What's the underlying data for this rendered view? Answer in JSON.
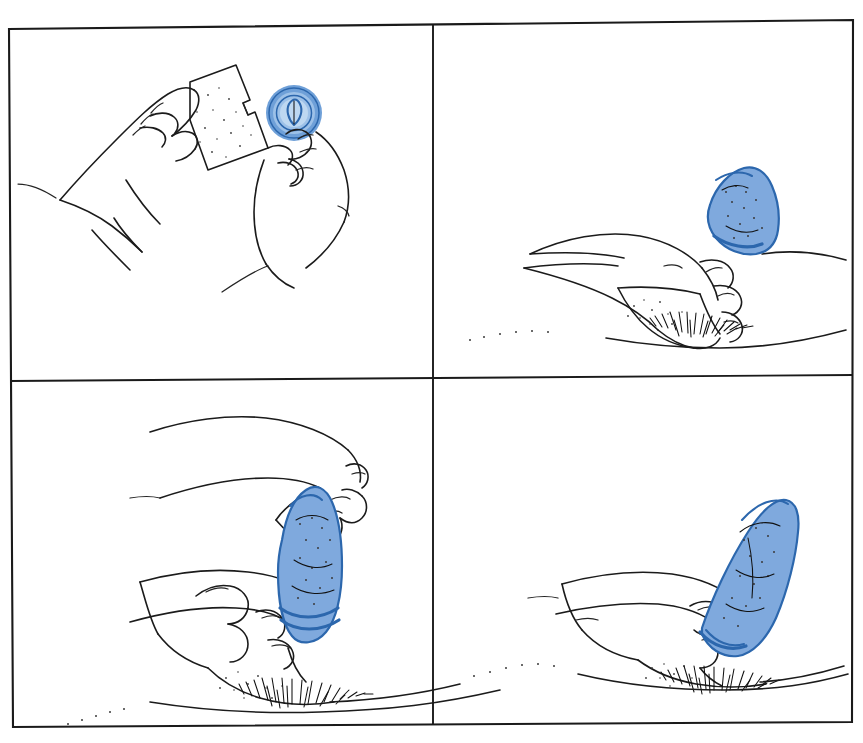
{
  "document": {
    "kind": "instructional-diagram",
    "title": "Condom use — step-by-step illustrated instructions",
    "description": "Wordless four-panel line-art health education sequence, scanned from a printed family-planning pamphlet.",
    "panel_count": 4,
    "has_captions": false,
    "has_step_numbers": false,
    "background_color": "#ffffff",
    "ink_color": "#1b1b1b",
    "accent_color": "#7fa9dd",
    "accent_outline_color": "#2c67ad"
  },
  "layout": {
    "canvas_width": 863,
    "canvas_height": 743,
    "grid_rows": 2,
    "grid_columns": 2,
    "frame_skew_note": "Scanned page: frame edges are slightly tilted, top edge rises left to right.",
    "frame": {
      "top_left_x": 9,
      "top_left_y": 29,
      "top_right_x": 853,
      "top_right_y": 20,
      "bottom_right_x": 852,
      "bottom_right_y": 722,
      "bottom_left_x": 13,
      "bottom_left_y": 727
    },
    "divider_vertical_x": 433,
    "divider_horizontal_y": 381
  },
  "panels": [
    {
      "id": "panel-1",
      "position": "top-left",
      "step_number": 1,
      "summary": "Opening the package",
      "subjects": [
        "left-hand-holding-wrapper",
        "right-hand-holding-rolled-condom"
      ],
      "elements": {
        "wrapper_label": "torn foil packet with notched corner",
        "condom_state": "rolled ring, still coiled",
        "condom_shape": "concentric circular ring pinched between thumb and forefinger"
      }
    },
    {
      "id": "panel-2",
      "position": "top-right",
      "step_number": 2,
      "summary": "Pinching the tip and placing it on the head",
      "subjects": [
        "hand-pinching-reservoir-tip",
        "second-hand-steadying"
      ],
      "elements": {
        "condom_state": "rolled, tip pinched, positioned at the top",
        "detail": "air squeezed out of the reservoir tip before unrolling"
      }
    },
    {
      "id": "panel-3",
      "position": "bottom-left",
      "step_number": 3,
      "summary": "Unrolling downward",
      "subjects": [
        "upper-hand-rolling-down",
        "lower-hand-holding-base"
      ],
      "elements": {
        "condom_state": "partially unrolled, rolled rim visible near the base",
        "detail": "rolled band being drawn down the full length"
      }
    },
    {
      "id": "panel-4",
      "position": "bottom-right",
      "step_number": 4,
      "summary": "Fully unrolled to the base",
      "subjects": [
        "hand-smoothing-to-base"
      ],
      "elements": {
        "condom_state": "completely unrolled, smooth along the full length",
        "detail": "rolled rim seated all the way down at the base"
      }
    }
  ]
}
